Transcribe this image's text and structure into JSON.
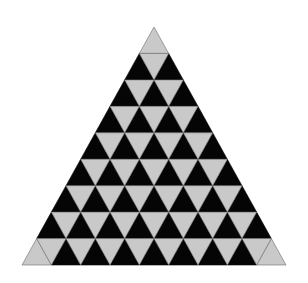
{
  "diagram": {
    "type": "triangular-grid",
    "rows": 9,
    "apex": [
      154,
      27
    ],
    "base_left": [
      22,
      265
    ],
    "base_right": [
      286,
      265
    ],
    "colors": {
      "background": "#ffffff",
      "dark": "#050505",
      "light": "#c9c9c9",
      "edge": "#6a6a6a"
    },
    "rules": {
      "up_triangles": "dark",
      "down_triangles": "light",
      "corner_up_triangles": "light"
    }
  }
}
